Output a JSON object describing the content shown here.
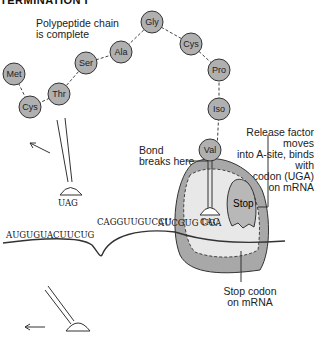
{
  "title": "TERMINATION I",
  "labels": {
    "polypeptide": [
      "Polypeptide chain",
      "is complete"
    ],
    "release": [
      "Release factor moves",
      "into A-site, binds with",
      "stop codon (UGA)",
      "on mRNA"
    ],
    "bond": [
      "Bond",
      "breaks here"
    ],
    "stop_codon": [
      "Stop codon",
      "on mRNA"
    ],
    "stop": "Stop"
  },
  "amino_acids": [
    "Met",
    "Cys",
    "Thr",
    "Ser",
    "Ala",
    "Gly",
    "Cys",
    "Pro",
    "Iso",
    "Val"
  ],
  "trna_anticodon": "UAG",
  "ribosome_anticodon": "CAC",
  "mrna_sequence": "AUGUGUACUUCUGCAGGUUGUCCUAUCGUGUGA",
  "mrna_codon_in_site": "GUG",
  "stop_codon": "UGA",
  "colors": {
    "circle_fill": "#b0b0b0",
    "ribosome_dark": "#a8a8a8",
    "ribosome_light": "#e8e8e8"
  }
}
